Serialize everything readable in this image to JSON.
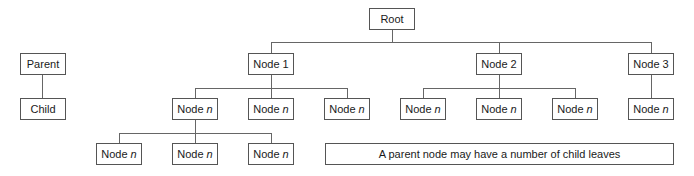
{
  "legend": {
    "parent_label": "Parent",
    "child_label": "Child"
  },
  "tree": {
    "root": "Root",
    "level1": [
      {
        "label": "Node 1"
      },
      {
        "label": "Node 2"
      },
      {
        "label": "Node 3"
      }
    ],
    "node_prefix": "Node",
    "node_var": "n",
    "level2_count": 7,
    "level3_count": 3
  },
  "caption": "A parent node may have a number of child leaves"
}
